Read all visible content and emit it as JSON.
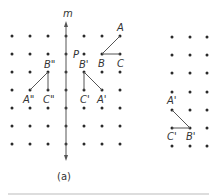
{
  "figure": {
    "panel_a": {
      "caption": "(a)",
      "mirror_line_label": "m",
      "point_p_label": "P",
      "labels": {
        "A": "A",
        "B": "B",
        "C": "C",
        "A1": "A'",
        "B1": "B'",
        "C1": "C'",
        "A2": "A\"",
        "B2": "B\"",
        "C2": "C\""
      }
    },
    "panel_b": {
      "labels": {
        "A1": "A'",
        "B1": "B'",
        "C1": "C'"
      }
    }
  },
  "colors": {
    "dot": "#2a2a2a",
    "line": "#555555",
    "divider": "#bbbbbb"
  }
}
